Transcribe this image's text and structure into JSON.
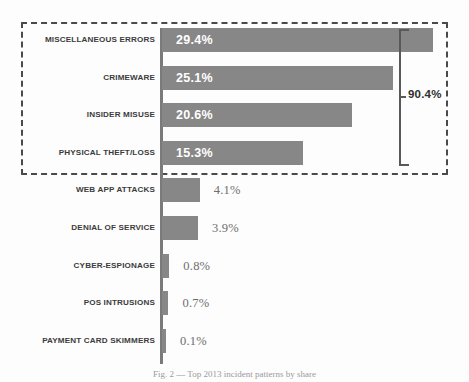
{
  "chart_data": {
    "type": "bar",
    "orientation": "horizontal",
    "title": "",
    "xlabel": "",
    "ylabel": "",
    "xlim": [
      0,
      29.4
    ],
    "grid": false,
    "legend": null,
    "value_suffix": "%",
    "categories": [
      "MISCELLANEOUS ERRORS",
      "CRIMEWARE",
      "INSIDER MISUSE",
      "PHYSICAL THEFT/LOSS",
      "WEB APP ATTACKS",
      "DENIAL OF SERVICE",
      "CYBER-ESPIONAGE",
      "POS INTRUSIONS",
      "PAYMENT CARD SKIMMERS"
    ],
    "values": [
      29.4,
      25.1,
      20.6,
      15.3,
      4.1,
      3.9,
      0.8,
      0.7,
      0.1
    ],
    "value_labels": [
      "29.4%",
      "25.1%",
      "20.6%",
      "15.3%",
      "4.1%",
      "3.9%",
      "0.8%",
      "0.7%",
      "0.1%"
    ],
    "annotations": [
      {
        "name": "cumulative-bracket",
        "label": "90.4%",
        "covers_categories": [
          "MISCELLANEOUS ERRORS",
          "CRIMEWARE",
          "INSIDER MISUSE",
          "PHYSICAL THEFT/LOSS"
        ]
      }
    ],
    "colors": {
      "bar": "#878787",
      "label_in_bar": "#ffffff",
      "label_out_bar": "#6e6e6e",
      "category_text": "#3b3b3b",
      "axis": "#7a7a7a",
      "highlight_border": "#4a4a4a",
      "bracket": "#595959"
    }
  },
  "rows": [
    {
      "label": "MISCELLANEOUS ERRORS",
      "value": "29.4%",
      "inside": true
    },
    {
      "label": "CRIMEWARE",
      "value": "25.1%",
      "inside": true
    },
    {
      "label": "INSIDER MISUSE",
      "value": "20.6%",
      "inside": true
    },
    {
      "label": "PHYSICAL THEFT/LOSS",
      "value": "15.3%",
      "inside": true
    },
    {
      "label": "WEB APP ATTACKS",
      "value": "4.1%",
      "inside": false
    },
    {
      "label": "DENIAL OF SERVICE",
      "value": "3.9%",
      "inside": false
    },
    {
      "label": "CYBER-ESPIONAGE",
      "value": "0.8%",
      "inside": false
    },
    {
      "label": "POS INTRUSIONS",
      "value": "0.7%",
      "inside": false
    },
    {
      "label": "PAYMENT CARD SKIMMERS",
      "value": "0.1%",
      "inside": false
    }
  ],
  "bracket": {
    "label": "90.4%"
  },
  "caption": {
    "text": "Fig. 2 — Top 2013 incident patterns by share"
  }
}
